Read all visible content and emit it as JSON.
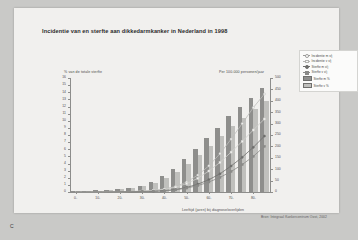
{
  "slide": {
    "corner_label": "C",
    "title": "Incidentie van en sterfte aan dikkedarmkanker in Nederland in 1998",
    "source": "Bron: Integraal Kankercentrum Oost, 2002"
  },
  "legend": {
    "items": [
      {
        "label": "Incidentie m v/j",
        "marker": "line-open-circle",
        "color": "#9a9a98"
      },
      {
        "label": "Incidentie v v/j",
        "marker": "line-open-square",
        "color": "#b5b5b2"
      },
      {
        "label": "Sterfte m v/j",
        "marker": "line-filled-circle",
        "color": "#6e6e6c"
      },
      {
        "label": "Sterfte v v/j",
        "marker": "line-filled-square",
        "color": "#8a8a88"
      },
      {
        "label": "Sterfte m %",
        "marker": "swatch",
        "color": "#8e8e8c"
      },
      {
        "label": "Sterfte v %",
        "marker": "swatch",
        "color": "#c0c0bd"
      }
    ]
  },
  "chart_data": {
    "type": "bar",
    "title": "Incidentie van en sterfte aan dikkedarmkanker in Nederland in 1998",
    "xlabel": "Leeftijd (jaren) bij diagnose/overlijden",
    "ylabel": "% van de totale sterfte",
    "y2label": "Per 100.000 personen/jaar",
    "ylim": [
      0,
      16
    ],
    "y2lim": [
      0,
      500
    ],
    "grid": false,
    "legend_position": "top-right",
    "categories": [
      "0-",
      "5-",
      "10-",
      "15-",
      "20-",
      "25-",
      "30-",
      "35-",
      "40-",
      "45-",
      "50-",
      "55-",
      "60-",
      "65-",
      "70-",
      "75-",
      "80-",
      "85+"
    ],
    "xtick_labels": [
      "0-",
      "10-",
      "20-",
      "30-",
      "40-",
      "50-",
      "60-",
      "70-",
      "80-"
    ],
    "ytick_labels": [
      "16",
      "15",
      "14",
      "13",
      "12",
      "11",
      "10",
      "9",
      "8",
      "7",
      "6",
      "5",
      "4",
      "3",
      "2",
      "1",
      "0"
    ],
    "y2tick_labels": [
      "500",
      "450",
      "400",
      "350",
      "300",
      "250",
      "200",
      "150",
      "100",
      "50",
      "0"
    ],
    "series": [
      {
        "name": "Sterfte m %",
        "axis": "left",
        "kind": "bar",
        "values": [
          0.2,
          0.2,
          0.3,
          0.3,
          0.4,
          0.6,
          0.9,
          1.4,
          2.2,
          3.2,
          4.6,
          6.0,
          7.6,
          9.0,
          10.6,
          12.0,
          13.2,
          14.6
        ]
      },
      {
        "name": "Sterfte v %",
        "axis": "left",
        "kind": "bar",
        "values": [
          0.2,
          0.2,
          0.2,
          0.3,
          0.4,
          0.5,
          0.8,
          1.2,
          1.9,
          2.8,
          4.0,
          5.2,
          6.5,
          7.8,
          9.2,
          10.4,
          11.6,
          12.8
        ]
      },
      {
        "name": "Incidentie m v/j",
        "axis": "right",
        "kind": "line",
        "values": [
          0,
          0,
          0,
          1,
          1,
          2,
          4,
          7,
          13,
          24,
          44,
          74,
          115,
          168,
          232,
          300,
          370,
          430
        ]
      },
      {
        "name": "Incidentie v v/j",
        "axis": "right",
        "kind": "line",
        "values": [
          0,
          0,
          0,
          1,
          1,
          2,
          4,
          7,
          12,
          21,
          37,
          60,
          92,
          130,
          175,
          222,
          272,
          320
        ]
      },
      {
        "name": "Sterfte m v/j",
        "axis": "right",
        "kind": "line",
        "values": [
          0,
          0,
          0,
          0,
          1,
          1,
          2,
          3,
          6,
          11,
          20,
          34,
          54,
          80,
          114,
          152,
          196,
          245
        ]
      },
      {
        "name": "Sterfte v v/j",
        "axis": "right",
        "kind": "line",
        "values": [
          0,
          0,
          0,
          0,
          1,
          1,
          2,
          3,
          5,
          9,
          17,
          28,
          44,
          64,
          90,
          120,
          156,
          200
        ]
      }
    ]
  }
}
